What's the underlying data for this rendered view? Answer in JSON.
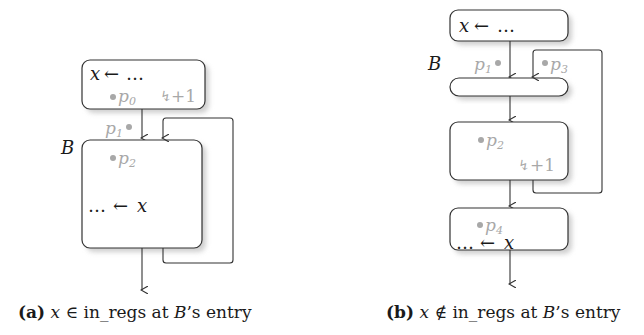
{
  "figure_a": {
    "caption_tag": "(a)",
    "caption_var": "x",
    "caption_op": "∈",
    "caption_rest": " in_regs at ",
    "caption_block": "B",
    "caption_tail": "’s entry",
    "block_label": "B",
    "top_block": {
      "assign_lhs": "x",
      "assign_arrow": "←",
      "assign_rhs": "…",
      "point": "p",
      "point_sub": "0",
      "spill_icon": "↯",
      "spill_count": "+1"
    },
    "entry_point": {
      "point": "p",
      "point_sub": "1"
    },
    "block_B": {
      "point": "p",
      "point_sub": "2",
      "use_lhs": "…",
      "use_arrow": "←",
      "use_rhs": "x"
    }
  },
  "figure_b": {
    "caption_tag": "(b)",
    "caption_var": "x",
    "caption_op": "∉",
    "caption_rest": " in_regs at ",
    "caption_block": "B",
    "caption_tail": "’s entry",
    "block_label": "B",
    "top_block": {
      "assign_lhs": "x",
      "assign_arrow": "←",
      "assign_rhs": "…"
    },
    "entry_points": [
      {
        "point": "p",
        "point_sub": "1"
      },
      {
        "point": "p",
        "point_sub": "3"
      }
    ],
    "middle_block": {
      "point": "p",
      "point_sub": "2",
      "spill_icon": "↯",
      "spill_count": "+1"
    },
    "bottom_block": {
      "point": "p",
      "point_sub": "4",
      "use_lhs": "…",
      "use_arrow": "←",
      "use_rhs": "x"
    }
  },
  "colors": {
    "stroke": "#333333",
    "annotation_grey": "#a8a8a8",
    "shadow": "#cfcfcf"
  }
}
